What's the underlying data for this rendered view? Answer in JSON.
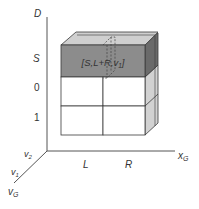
{
  "diagram": {
    "type": "3d-grid-cube",
    "axes": {
      "vertical": {
        "label": "D"
      },
      "horizontal": {
        "label": "x",
        "subscript": "G"
      },
      "depth": {
        "label": "v",
        "subscript": "G"
      }
    },
    "row_labels": [
      "S",
      "0",
      "1"
    ],
    "column_labels": [
      "L",
      "R"
    ],
    "depth_labels": [
      {
        "label": "v",
        "subscript": "2"
      },
      {
        "label": "v",
        "subscript": "1"
      }
    ],
    "highlighted_cell": {
      "text": "[S,L+R,v",
      "subscript": "1",
      "suffix": "]",
      "row": "S",
      "columns": [
        "L",
        "R"
      ],
      "depth": "v1"
    },
    "colors": {
      "highlight_front": "#8c8c8c",
      "highlight_side": "#6a6a6a",
      "top_face": "#cfcfcf",
      "side_face": "#d2d2d2",
      "line": "#3a3a3a"
    }
  }
}
